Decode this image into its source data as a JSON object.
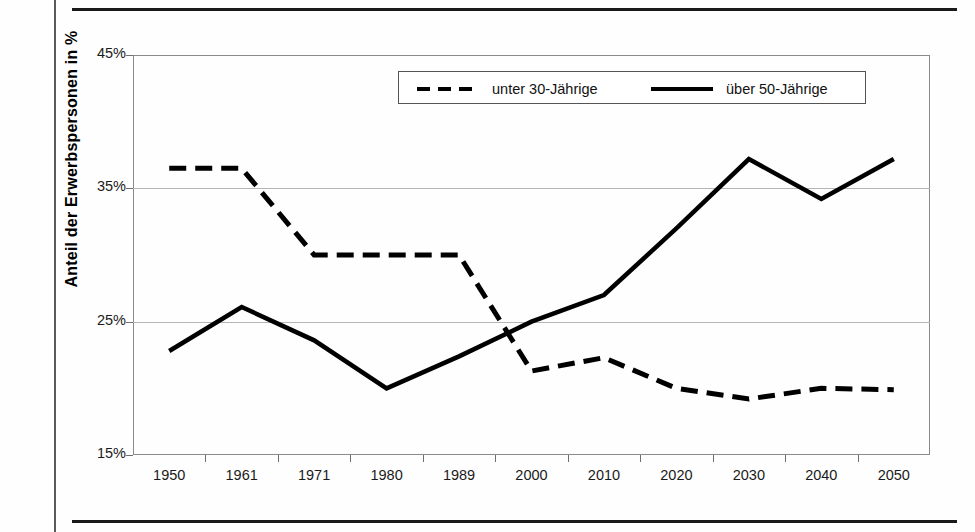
{
  "page": {
    "background_color": "#fefefe",
    "rule_color": "#1a1a1a"
  },
  "chart_data": {
    "type": "line",
    "title": "",
    "xlabel": "",
    "ylabel": "Anteil der Erwerbspersonen in %",
    "categories": [
      "1950",
      "1961",
      "1971",
      "1980",
      "1989",
      "2000",
      "2010",
      "2020",
      "2030",
      "2040",
      "2050"
    ],
    "ytick_labels": [
      "45%",
      "35%",
      "25%",
      "15%"
    ],
    "ytick_values": [
      45,
      35,
      25,
      15
    ],
    "ylim": [
      15,
      45
    ],
    "grid": "horizontal",
    "legend_position": "top-center-inside",
    "series": [
      {
        "name": "unter 30-Jährige",
        "style": "dashed",
        "color": "#000000",
        "values": [
          36.5,
          36.5,
          30.0,
          30.0,
          30.0,
          21.3,
          22.3,
          20.0,
          19.2,
          20.0,
          19.9
        ]
      },
      {
        "name": "über 50-Jährige",
        "style": "solid",
        "color": "#000000",
        "values": [
          22.8,
          26.1,
          23.6,
          20.0,
          22.4,
          25.0,
          27.0,
          32.0,
          37.2,
          34.2,
          37.2
        ]
      }
    ]
  },
  "legend": {
    "items": [
      {
        "label": "unter 30-Jährige",
        "style": "dashed"
      },
      {
        "label": "über 50-Jährige",
        "style": "solid"
      }
    ]
  }
}
